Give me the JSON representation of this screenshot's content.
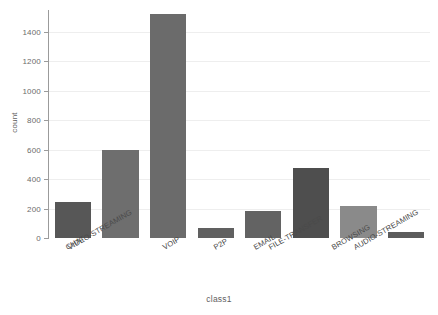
{
  "chart_data": {
    "type": "bar",
    "title": "",
    "subtitle": "",
    "xlabel": "class1",
    "ylabel": "count",
    "categories": [
      "CHAT",
      "VIDEO-STREAMING",
      "VOIP",
      "P2P",
      "EMAIL",
      "FILE-TRANSFER",
      "BROWSING",
      "AUDIO-STREAMING"
    ],
    "values": [
      245,
      595,
      1520,
      65,
      185,
      475,
      215,
      40
    ],
    "bar_colors": [
      "#575757",
      "#6e6e6e",
      "#6b6b6b",
      "#606060",
      "#636363",
      "#4e4e4e",
      "#8a8a8a",
      "#5c5c5c"
    ],
    "ylim": [
      0,
      1550
    ],
    "yticks": [
      0,
      200,
      400,
      600,
      800,
      1000,
      1200,
      1400
    ],
    "ytick_labels": [
      "0",
      "200",
      "400",
      "600",
      "800",
      "1000",
      "1200",
      "1400"
    ],
    "xtick_label_rotation": -30,
    "grid": {
      "horizontal": true,
      "vertical": false,
      "color": "#eeeeee"
    },
    "legend": {
      "visible": false,
      "position": "none",
      "entries": []
    },
    "axis_color": "#9b9b9b",
    "background_color": "#ffffff",
    "text_color": "#5a5a5a",
    "annotations": []
  }
}
